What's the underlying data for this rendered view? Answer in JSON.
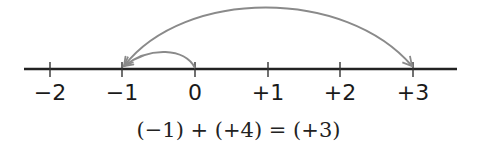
{
  "diagram": {
    "type": "number-line",
    "ticks": [
      {
        "value": -2,
        "label": "−2",
        "x": 50
      },
      {
        "value": -1,
        "label": "−1",
        "x": 122
      },
      {
        "value": 0,
        "label": "0",
        "x": 195
      },
      {
        "value": 1,
        "label": "+1",
        "x": 268
      },
      {
        "value": 2,
        "label": "+2",
        "x": 340
      },
      {
        "value": 3,
        "label": "+3",
        "x": 413
      }
    ],
    "arcs": [
      {
        "from": 0,
        "to": -1,
        "description": "small arc from 0 to -1"
      },
      {
        "from": -1,
        "to": 3,
        "description": "large arc between -1 and +3"
      }
    ],
    "equation": "(−1) + (+4) = (+3)",
    "colors": {
      "axis": "#222222",
      "arc": "#8a8a8a",
      "text": "#1a1a1a"
    }
  }
}
